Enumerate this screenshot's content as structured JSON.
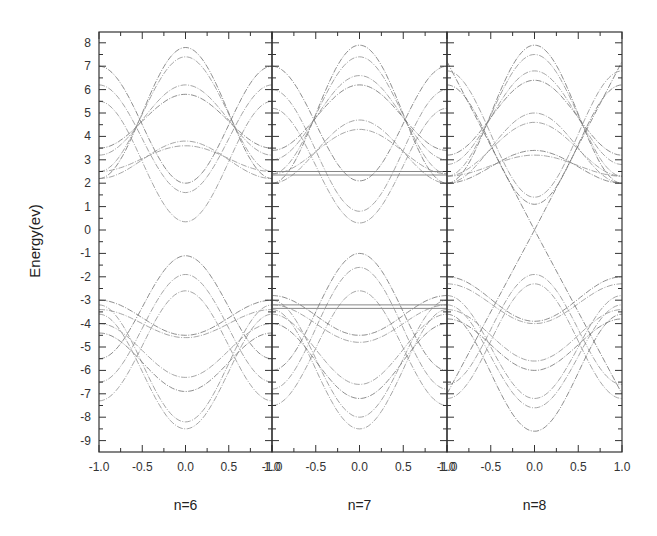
{
  "chart_data": {
    "type": "line",
    "title": "",
    "ylabel": "Energy(ev)",
    "ylim": [
      -9.5,
      8.5
    ],
    "yticks": [
      8,
      7,
      6,
      5,
      4,
      3,
      2,
      1,
      0,
      -1,
      -2,
      -3,
      -4,
      -5,
      -6,
      -7,
      -8,
      -9
    ],
    "grid": false,
    "legend": "none",
    "panels": [
      {
        "label": "n=6",
        "xlabel": "n=6",
        "xlim": [
          -1.0,
          1.0
        ],
        "xticks": [
          "-1.0",
          "-0.5",
          "0.0",
          "0.5",
          "1.0"
        ],
        "bands_center_edge": [
          [
            7.8,
            2.2
          ],
          [
            7.4,
            2.5
          ],
          [
            6.2,
            3.2
          ],
          [
            5.8,
            3.5
          ],
          [
            3.8,
            2.2
          ],
          [
            3.6,
            2.5
          ],
          [
            2.0,
            7.0
          ],
          [
            1.6,
            6.2
          ],
          [
            0.35,
            5.5
          ],
          [
            -1.1,
            -5.5
          ],
          [
            -1.9,
            -6.5
          ],
          [
            -2.6,
            -7.3
          ],
          [
            -4.5,
            -3.0
          ],
          [
            -4.6,
            -3.4
          ],
          [
            -6.3,
            -4.0
          ],
          [
            -6.9,
            -4.4
          ],
          [
            -8.2,
            -3.2
          ],
          [
            -8.5,
            -3.6
          ]
        ],
        "flat_bands": []
      },
      {
        "label": "n=7",
        "xlabel": "n=7",
        "xlim": [
          -1.0,
          1.0
        ],
        "xticks": [
          "-1.0",
          "-0.5",
          "0.0",
          "0.5",
          "1.0"
        ],
        "bands_center_edge": [
          [
            7.9,
            2.0
          ],
          [
            7.4,
            2.4
          ],
          [
            6.6,
            3.0
          ],
          [
            6.2,
            3.4
          ],
          [
            4.7,
            2.0
          ],
          [
            4.3,
            2.4
          ],
          [
            2.1,
            7.0
          ],
          [
            0.8,
            6.0
          ],
          [
            0.3,
            5.2
          ],
          [
            -1.0,
            -6.0
          ],
          [
            -1.6,
            -6.8
          ],
          [
            -2.6,
            -7.5
          ],
          [
            -4.5,
            -2.8
          ],
          [
            -4.8,
            -3.2
          ],
          [
            -6.6,
            -3.6
          ],
          [
            -7.2,
            -4.0
          ],
          [
            -8.0,
            -3.0
          ],
          [
            -8.5,
            -3.4
          ]
        ],
        "flat_bands": [
          2.5,
          2.35,
          -3.2,
          -3.35
        ]
      },
      {
        "label": "n=8",
        "xlabel": "n=8",
        "xlim": [
          -1.0,
          1.0
        ],
        "xticks": [
          "-1.0",
          "-0.5",
          "0.0",
          "0.5",
          "1.0"
        ],
        "bands_center_edge": [
          [
            7.9,
            2.0
          ],
          [
            7.5,
            2.3
          ],
          [
            6.8,
            2.8
          ],
          [
            6.4,
            3.2
          ],
          [
            5.0,
            2.0
          ],
          [
            4.6,
            2.3
          ],
          [
            3.4,
            2.0
          ],
          [
            3.2,
            2.3
          ],
          [
            1.4,
            6.8
          ],
          [
            1.1,
            6.2
          ],
          [
            -1.9,
            -6.6
          ],
          [
            -2.3,
            -7.2
          ],
          [
            -3.9,
            -2.0
          ],
          [
            -4.0,
            -2.3
          ],
          [
            -5.6,
            -3.4
          ],
          [
            -6.0,
            -3.8
          ],
          [
            -7.2,
            -2.8
          ],
          [
            -7.6,
            -3.2
          ],
          [
            -8.6,
            -3.6
          ]
        ],
        "linear_bands": [
          [
            0.0,
            7.2
          ],
          [
            0.0,
            -7.0
          ]
        ],
        "flat_bands": []
      }
    ]
  }
}
